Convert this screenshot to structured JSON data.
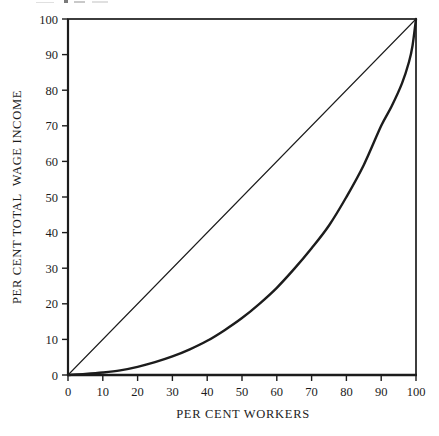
{
  "figure": {
    "background": "#ffffff",
    "ink_color": "#1c1c1c"
  },
  "chart_data": {
    "type": "line",
    "title": "",
    "xlabel": "PER CENT WORKERS",
    "ylabel": "PER CENT TOTAL  WAGE INCOME",
    "xlim": [
      0,
      100
    ],
    "ylim": [
      0,
      100
    ],
    "x_ticks": [
      0,
      10,
      20,
      30,
      40,
      50,
      60,
      70,
      80,
      90,
      100
    ],
    "y_ticks": [
      0,
      10,
      20,
      30,
      40,
      50,
      60,
      70,
      80,
      90,
      100
    ],
    "grid": false,
    "legend": "none",
    "plot_box": true,
    "series": [
      {
        "name": "line-of-equality",
        "shape": "straight",
        "stroke_width": 1.1,
        "points": [
          [
            0,
            0
          ],
          [
            100,
            100
          ]
        ]
      },
      {
        "name": "lorenz-curve",
        "shape": "smooth",
        "stroke_width": 2.4,
        "points": [
          [
            0,
            0
          ],
          [
            5,
            0.3
          ],
          [
            10,
            0.7
          ],
          [
            15,
            1.3
          ],
          [
            20,
            2.3
          ],
          [
            25,
            3.6
          ],
          [
            30,
            5.2
          ],
          [
            35,
            7.2
          ],
          [
            40,
            9.6
          ],
          [
            45,
            12.6
          ],
          [
            50,
            16
          ],
          [
            55,
            20
          ],
          [
            60,
            24.5
          ],
          [
            65,
            29.8
          ],
          [
            70,
            35.6
          ],
          [
            75,
            42
          ],
          [
            80,
            50
          ],
          [
            85,
            59
          ],
          [
            90,
            70
          ],
          [
            93,
            75.5
          ],
          [
            96,
            82
          ],
          [
            98,
            88
          ],
          [
            99,
            92.5
          ],
          [
            100,
            100
          ]
        ]
      }
    ]
  }
}
